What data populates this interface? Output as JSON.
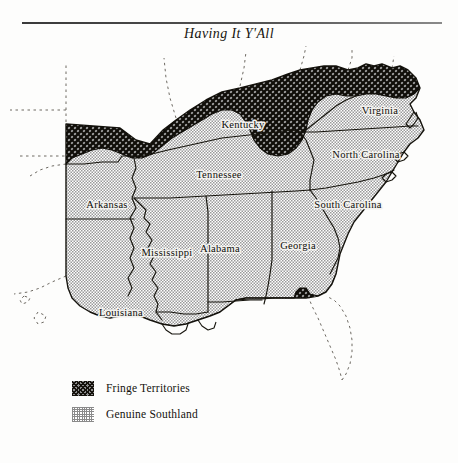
{
  "page": {
    "title": "Having It Y'All",
    "background_color": "#fdfdfc",
    "rule_color": "#3a3a3a"
  },
  "legend": {
    "items": [
      {
        "label": "Fringe Territories",
        "pattern": "dark-crosshatch",
        "color": "#15120c"
      },
      {
        "label": "Genuine Southland",
        "pattern": "light-stipple",
        "color": "#8a8a8a"
      }
    ]
  },
  "map": {
    "region": "American South",
    "state_labels": [
      {
        "name": "Kentucky",
        "x": 243,
        "y": 84
      },
      {
        "name": "Virginia",
        "x": 380,
        "y": 70
      },
      {
        "name": "Tennessee",
        "x": 219,
        "y": 134
      },
      {
        "name": "North Carolina",
        "x": 366,
        "y": 114
      },
      {
        "name": "South Carolina",
        "x": 348,
        "y": 164
      },
      {
        "name": "Arkansas",
        "x": 107,
        "y": 164
      },
      {
        "name": "Mississippi",
        "x": 167,
        "y": 212
      },
      {
        "name": "Alabama",
        "x": 220,
        "y": 208
      },
      {
        "name": "Georgia",
        "x": 298,
        "y": 205
      },
      {
        "name": "Louisiana",
        "x": 121,
        "y": 272
      }
    ],
    "fills": {
      "genuine_southland": "#c9c9c9",
      "fringe_territories": "#3b3833",
      "unshaded": "#fdfdfc"
    },
    "notes": [
      "Genuine Southland covers Arkansas, Louisiana, Mississippi, Alabama, Georgia, Tennessee, Kentucky, the Carolinas and Virginia.",
      "Fringe Territories form a band along the Ohio River in Kentucky, across the Appalachians into West Virginia, and along the Gulf coast of the Florida panhandle.",
      "Florida peninsula and surrounding non-Southern states are outlined with dotted lines and left unshaded."
    ]
  }
}
